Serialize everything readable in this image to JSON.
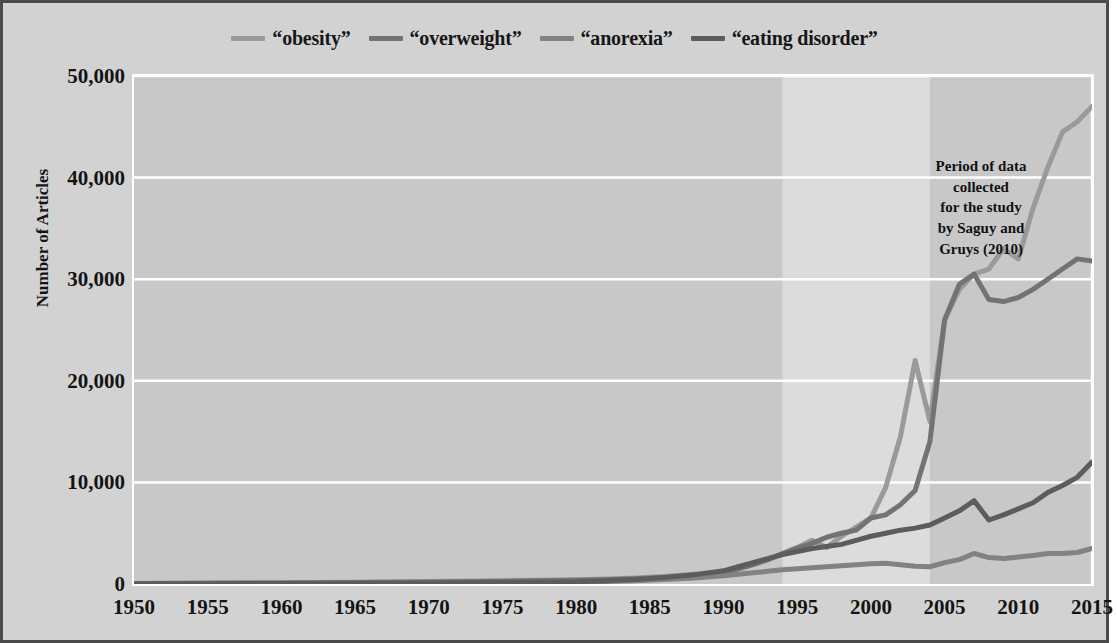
{
  "figure": {
    "background_color": "#d2d2d2",
    "border_color": "#4a4a4a",
    "plot_background_color": "#c8c8c8",
    "gridline_color": "#ffffff",
    "highlight_band_color": "#dcdcdc"
  },
  "annotation": {
    "text": "Period of data collected for the study by Saguy and Gruys (2010)",
    "line1": "Period of data",
    "line2": "collected",
    "line3": "for the study",
    "line4": "by Saguy and",
    "line5": "Gruys (2010)",
    "band_start_year": 1994,
    "band_end_year": 2004
  },
  "chart_data": {
    "type": "line",
    "title": "",
    "subtitle": "",
    "xlabel": "",
    "ylabel": "Number of Articles",
    "xlim": [
      1950,
      2015
    ],
    "ylim": [
      0,
      50000
    ],
    "grid": true,
    "legend_position": "top-center",
    "x_ticks": [
      1950,
      1955,
      1960,
      1965,
      1970,
      1975,
      1980,
      1985,
      1990,
      1995,
      2000,
      2005,
      2010,
      2015
    ],
    "x_tick_labels": [
      "1950",
      "1955",
      "1960",
      "1965",
      "1970",
      "1975",
      "1980",
      "1985",
      "1990",
      "1995",
      "2000",
      "2005",
      "2010",
      "2015"
    ],
    "y_ticks": [
      0,
      10000,
      20000,
      30000,
      40000,
      50000
    ],
    "y_tick_labels": [
      "0",
      "10,000",
      "20,000",
      "30,000",
      "40,000",
      "50,000"
    ],
    "x": [
      1950,
      1955,
      1960,
      1965,
      1970,
      1975,
      1980,
      1982,
      1984,
      1986,
      1988,
      1990,
      1991,
      1992,
      1993,
      1994,
      1995,
      1996,
      1997,
      1998,
      1999,
      2000,
      2001,
      2002,
      2003,
      2004,
      2005,
      2006,
      2007,
      2008,
      2009,
      2010,
      2011,
      2012,
      2013,
      2014,
      2015
    ],
    "series": [
      {
        "name": "“obesity”",
        "color": "#9a9a9a",
        "values": [
          60,
          90,
          130,
          180,
          250,
          330,
          430,
          500,
          600,
          750,
          950,
          1200,
          1500,
          1900,
          2400,
          3000,
          3600,
          4300,
          3600,
          4700,
          5600,
          6500,
          9500,
          14500,
          22000,
          16000,
          26000,
          29000,
          30500,
          31000,
          33000,
          32000,
          37000,
          41000,
          44500,
          45500,
          47000
        ]
      },
      {
        "name": "“overweight”",
        "color": "#737373",
        "values": [
          50,
          70,
          100,
          140,
          200,
          270,
          360,
          430,
          520,
          650,
          850,
          1100,
          1500,
          1900,
          2400,
          3000,
          3500,
          4000,
          4600,
          5000,
          5300,
          6500,
          6800,
          7800,
          9200,
          14000,
          26000,
          29500,
          30500,
          28000,
          27800,
          28200,
          29000,
          30000,
          31000,
          32000,
          31800
        ]
      },
      {
        "name": "“anorexia”",
        "color": "#828282",
        "values": [
          30,
          40,
          55,
          70,
          95,
          130,
          190,
          250,
          330,
          450,
          600,
          800,
          950,
          1100,
          1250,
          1400,
          1500,
          1600,
          1700,
          1800,
          1900,
          2000,
          2050,
          1900,
          1750,
          1700,
          2100,
          2400,
          3000,
          2600,
          2500,
          2650,
          2800,
          3000,
          3000,
          3100,
          3500
        ]
      },
      {
        "name": "“eating disorder”",
        "color": "#5c5c5c",
        "values": [
          20,
          30,
          45,
          65,
          95,
          140,
          220,
          320,
          450,
          650,
          900,
          1300,
          1700,
          2100,
          2500,
          2900,
          3200,
          3500,
          3700,
          3900,
          4300,
          4700,
          5000,
          5300,
          5500,
          5800,
          6500,
          7200,
          8200,
          6300,
          6800,
          7400,
          8000,
          9000,
          9700,
          10500,
          12000
        ]
      }
    ]
  }
}
